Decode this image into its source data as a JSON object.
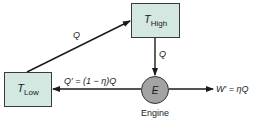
{
  "diagram": {
    "type": "heat-engine-flow",
    "colors": {
      "box_fill": "#d3e8e1",
      "engine_fill": "#a3a3a3",
      "stroke": "#1a1a1a"
    },
    "nodes": {
      "t_high": {
        "symbol": "T",
        "subscript": "High"
      },
      "t_low": {
        "symbol": "T",
        "subscript": "Low"
      },
      "engine": {
        "symbol": "E",
        "caption": "Engine"
      }
    },
    "edges": {
      "low_to_high": {
        "label": "Q"
      },
      "high_to_engine": {
        "label": "Q"
      },
      "engine_to_low": {
        "label": "Q′ = (1 − η)Q"
      },
      "engine_work": {
        "label": "W′ = ηQ"
      }
    }
  }
}
